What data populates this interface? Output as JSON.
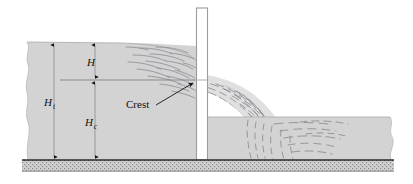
{
  "figure": {
    "labels": {
      "head_over_crest": "H",
      "head_over_crest_desc": "H",
      "total_head": "H",
      "total_head_sub": "t",
      "crest_height": "H",
      "crest_height_sub": "c",
      "crest": "Crest"
    },
    "colors": {
      "water_fill": "#d3d3d3",
      "water_stroke": "#b4b4b4",
      "ground_fill": "#c9c9c9",
      "ground_stroke": "#2b2b2b",
      "streamline": "#8a8a93",
      "dimension_line": "#7a7a7a",
      "arrow": "#141414",
      "plate_fill": "#ffffff",
      "plate_stroke": "#9a9aa0",
      "text": "#111111",
      "background": "#ffffff"
    },
    "geometry": {
      "upstream_water_surface_y": 42,
      "crest_level_y": 80,
      "ground_top_y": 160,
      "ground_bottom_y": 172,
      "weir_plate_x": 196,
      "weir_plate_top_y": 8,
      "downstream_water_surface_y": 117,
      "image_width": 413,
      "image_height": 184
    },
    "dimensions": [
      {
        "name": "H",
        "from_y": 42,
        "to_y": 80,
        "x": 95
      },
      {
        "name": "Ht",
        "from_y": 42,
        "to_y": 160,
        "x": 54
      },
      {
        "name": "Hc",
        "from_y": 80,
        "to_y": 160,
        "x": 95
      }
    ],
    "annotation": {
      "text": "Crest",
      "text_x": 126,
      "text_y": 108,
      "arrow_from_x": 156,
      "arrow_from_y": 106,
      "arrow_to_x": 194,
      "arrow_to_y": 82
    }
  }
}
